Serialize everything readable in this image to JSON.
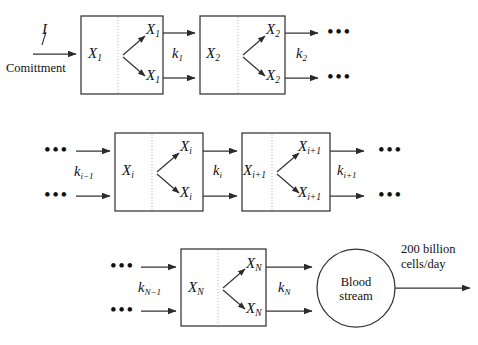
{
  "figure": {
    "type": "block-flow-diagram",
    "title_text": "",
    "background": "#ffffff",
    "stroke": "#333333",
    "divider_stroke": "#aaaaaa"
  },
  "rows": [
    {
      "id": "row-1",
      "input": {
        "rate_label": "I",
        "caption": "Comittment"
      },
      "blocks": [
        {
          "id": "block-x1",
          "left_label": "X",
          "left_sub": "1",
          "out_top_label": "X",
          "out_top_sub": "1",
          "out_bottom_label": "X",
          "out_bottom_sub": "1"
        },
        {
          "id": "block-x2",
          "left_label": "X",
          "left_sub": "2",
          "out_top_label": "X",
          "out_top_sub": "2",
          "out_bottom_label": "X",
          "out_bottom_sub": "2"
        }
      ],
      "rates": [
        {
          "id": "k1",
          "label": "k",
          "sub": "1"
        },
        {
          "id": "k2",
          "label": "k",
          "sub": "2"
        }
      ],
      "trailing_ellipsis": [
        "•••",
        "•••"
      ]
    },
    {
      "id": "row-2",
      "leading_ellipsis": [
        "•••",
        "•••"
      ],
      "blocks": [
        {
          "id": "block-xi",
          "left_label": "X",
          "left_sub": "i",
          "out_top_label": "X",
          "out_top_sub": "i",
          "out_bottom_label": "X",
          "out_bottom_sub": "i"
        },
        {
          "id": "block-xi1",
          "left_label": "X",
          "left_sub": "i+1",
          "out_top_label": "X",
          "out_top_sub": "i+1",
          "out_bottom_label": "X",
          "out_bottom_sub": "i+1"
        }
      ],
      "rates": [
        {
          "id": "ki-1",
          "label": "k",
          "sub": "i−1"
        },
        {
          "id": "ki",
          "label": "k",
          "sub": "i"
        },
        {
          "id": "ki+1",
          "label": "k",
          "sub": "i+1"
        }
      ],
      "trailing_ellipsis": [
        "•••",
        "•••"
      ]
    },
    {
      "id": "row-3",
      "leading_ellipsis": [
        "•••",
        "•••"
      ],
      "blocks": [
        {
          "id": "block-xn",
          "left_label": "X",
          "left_sub": "N",
          "out_top_label": "X",
          "out_top_sub": "N",
          "out_bottom_label": "X",
          "out_bottom_sub": "N"
        }
      ],
      "rates": [
        {
          "id": "kn-1",
          "label": "k",
          "sub": "N−1"
        },
        {
          "id": "kn",
          "label": "k",
          "sub": "N"
        }
      ],
      "sink": {
        "id": "blood-stream",
        "line1": "Blood",
        "line2": "stream"
      },
      "output": {
        "line1": "200 billion",
        "line2": "cells/day"
      }
    }
  ]
}
